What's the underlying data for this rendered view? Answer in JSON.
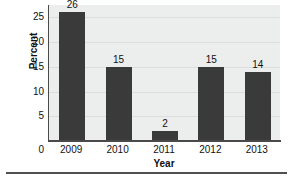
{
  "chart_data": {
    "type": "bar",
    "title": "",
    "categories": [
      "2009",
      "2010",
      "2011",
      "2012",
      "2013"
    ],
    "values": [
      26,
      15,
      2,
      15,
      14
    ],
    "xlabel": "Year",
    "ylabel": "Percent",
    "ylim": [
      0,
      27.5
    ],
    "yticks": [
      0,
      5,
      10,
      15,
      20,
      25
    ],
    "ytick_labels": [
      "0",
      "5",
      "10",
      "15",
      "20",
      "25"
    ],
    "origin_label": "0",
    "data_labels": [
      "26",
      "15",
      "2",
      "15",
      "14"
    ],
    "grid": true,
    "grid_axis": "y",
    "legend": false,
    "bar_color": "#3a3a3a",
    "plot_background": "#eceded",
    "axis_color": "#4a4a4a",
    "text_color": "#111111"
  }
}
